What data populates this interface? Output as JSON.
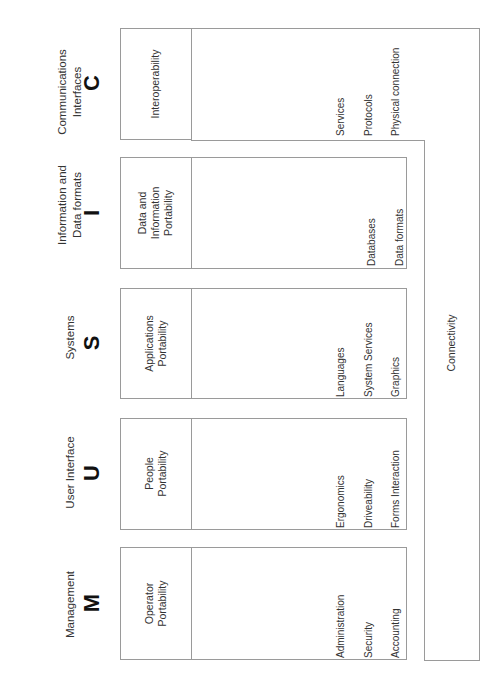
{
  "columns": [
    {
      "key": "C",
      "category": "Communications\nInterfaces",
      "category_lines": [
        "Communications",
        "Interfaces"
      ],
      "letter": "C",
      "portability": [
        "Interoperability"
      ],
      "items": [
        "Services",
        "Protocols",
        "Physical connection"
      ]
    },
    {
      "key": "I",
      "category_lines": [
        "Information and",
        "Data formats"
      ],
      "letter": "I",
      "portability": [
        "Data and",
        "Information",
        "Portability"
      ],
      "items": [
        "Databases",
        "Data formats"
      ]
    },
    {
      "key": "S",
      "category_lines": [
        "Systems"
      ],
      "letter": "S",
      "portability": [
        "Applications",
        "Portability"
      ],
      "items": [
        "Languages",
        "System Services",
        "Graphics"
      ]
    },
    {
      "key": "U",
      "category_lines": [
        "User Interface"
      ],
      "letter": "U",
      "portability": [
        "People",
        "Portability"
      ],
      "items": [
        "Ergonomics",
        "Driveability",
        "Forms Interaction"
      ]
    },
    {
      "key": "M",
      "category_lines": [
        "Management"
      ],
      "letter": "M",
      "portability": [
        "Operator",
        "Portability"
      ],
      "items": [
        "Administration",
        "Security",
        "Accounting"
      ]
    }
  ],
  "connectivity_label": "Connectivity",
  "colors": {
    "border": "#9a9a9a",
    "text": "#333333",
    "letters": "#111111"
  }
}
